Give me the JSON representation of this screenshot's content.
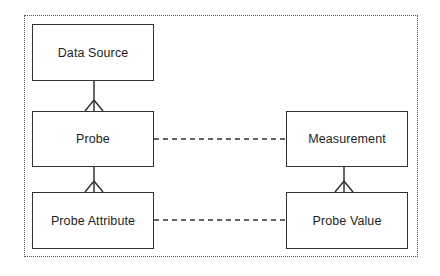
{
  "diagram": {
    "type": "entity-relationship",
    "entities": [
      {
        "id": "data_source",
        "label": "Data Source"
      },
      {
        "id": "probe",
        "label": "Probe"
      },
      {
        "id": "probe_attribute",
        "label": "Probe Attribute"
      },
      {
        "id": "measurement",
        "label": "Measurement"
      },
      {
        "id": "probe_value",
        "label": "Probe Value"
      }
    ],
    "relationships": [
      {
        "from": "data_source",
        "to": "probe",
        "style": "solid",
        "cardinality": "one-to-many"
      },
      {
        "from": "probe",
        "to": "probe_attribute",
        "style": "solid",
        "cardinality": "one-to-many"
      },
      {
        "from": "measurement",
        "to": "probe_value",
        "style": "solid",
        "cardinality": "one-to-many"
      },
      {
        "from": "probe",
        "to": "measurement",
        "style": "dashed"
      },
      {
        "from": "probe_attribute",
        "to": "probe_value",
        "style": "dashed"
      }
    ],
    "colors": {
      "line": "#333333",
      "frame": "#555555",
      "background": "#ffffff"
    }
  }
}
